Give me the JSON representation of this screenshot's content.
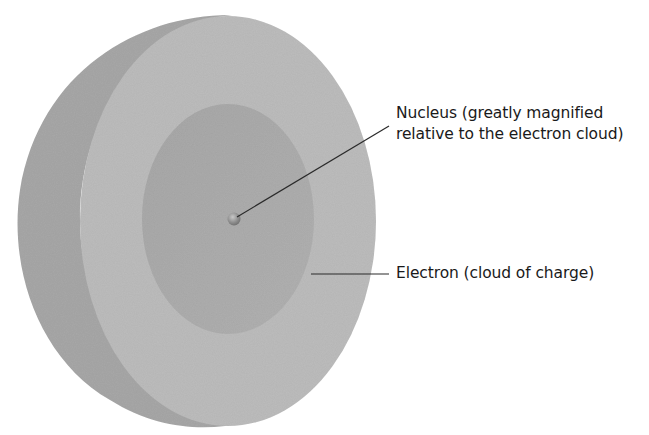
{
  "diagram": {
    "colors": {
      "background": "#ffffff",
      "outer_shell_back": "#a9a9a9",
      "outer_shell_front": "#bdbdbd",
      "inner_hollow": "#adadad",
      "nucleus": "#8f8f8f",
      "leader_line": "#2a2a2a",
      "text": "#1a1a1a"
    },
    "labels": {
      "nucleus": {
        "line1": "Nucleus (greatly magnified",
        "line2": "relative to the electron cloud)"
      },
      "electron": {
        "text": "Electron (cloud of charge)"
      }
    }
  }
}
